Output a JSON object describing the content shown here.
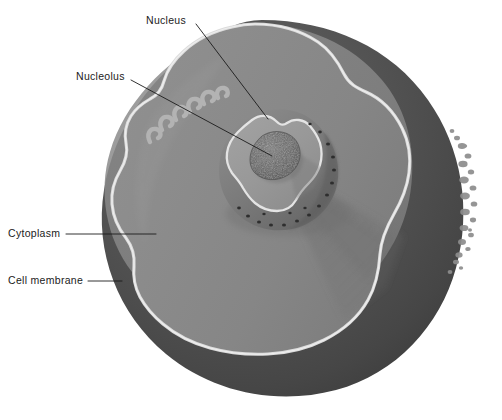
{
  "figure": {
    "background_color": "#ffffff",
    "width": 502,
    "height": 420
  },
  "labels": [
    {
      "id": "nucleus",
      "text": "Nucleus",
      "x": 146,
      "y": 15,
      "leader_from": [
        196,
        24
      ],
      "leader_to": [
        268,
        119
      ]
    },
    {
      "id": "nucleolus",
      "text": "Nucleolus",
      "x": 76,
      "y": 71,
      "leader_from": [
        131,
        80
      ],
      "leader_to": [
        272,
        156
      ]
    },
    {
      "id": "cytoplasm",
      "text": "Cytoplasm",
      "x": 8,
      "y": 228,
      "leader_from": [
        66,
        234
      ],
      "leader_to": [
        156,
        234
      ]
    },
    {
      "id": "cell-membrane",
      "text": "Cell membrane",
      "x": 8,
      "y": 275,
      "leader_from": [
        88,
        281
      ],
      "leader_to": [
        122,
        281
      ]
    }
  ],
  "colors": {
    "outer_sphere_dark": "#4e4e4e",
    "outer_sphere_darker": "#3f3f3f",
    "cytoplasm_face": "#8b8b8b",
    "cytoplasm_face_light": "#959595",
    "cytoplasm_shadow": "#7c7c7c",
    "membrane_line": "#d8d8d8",
    "membrane_highlight": "#e6e6e6",
    "nucleus_face": "#9a9a9a",
    "nucleus_rim": "#7a7a7a",
    "nucleus_rim_shadow": "#6a6a6a",
    "nucleolus": "#5f5f5f",
    "nuclear_pore": "#2f2f2f",
    "leader_line": "#1b1b1b",
    "label_text": "#1b1b1b"
  },
  "structures": {
    "cell_membrane": {
      "name": "Cell membrane",
      "description": "light wavy outline tracing the cut edge of the cell"
    },
    "cytoplasm": {
      "name": "Cytoplasm",
      "description": "large mid-gray cut face filling the interior of the cell"
    },
    "nucleus": {
      "name": "Nucleus",
      "description": "heart-shaped cutaway sphere near the cell centre with nuclear pores along the rim",
      "pore_count": 18
    },
    "nucleolus": {
      "name": "Nucleolus",
      "description": "small granular stippled body inside the nucleus"
    },
    "microvilli": {
      "name": "Microvilli",
      "description": "small finger-like projections along the upper-left and right outer membrane",
      "left_count": 6,
      "right_count": 22
    }
  }
}
